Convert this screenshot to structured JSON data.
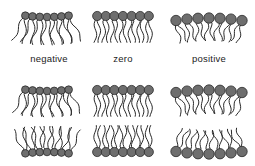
{
  "figure": {
    "labels": [
      "negative",
      "zero",
      "positive"
    ],
    "colors": {
      "head_fill": "#6e6e6e",
      "head_stroke": "#2a2a2a",
      "tail": "#2a2a2a"
    },
    "monolayers": [
      {
        "name": "negative",
        "center_x": 47,
        "head_y": 17,
        "tail_dir": 1,
        "curvature": "negative"
      },
      {
        "name": "zero",
        "center_x": 123,
        "head_y": 16,
        "tail_dir": 1,
        "curvature": "zero"
      },
      {
        "name": "positive",
        "center_x": 209,
        "head_y": 18,
        "tail_dir": 1,
        "curvature": "positive"
      }
    ],
    "bilayers": [
      {
        "name": "negative",
        "center_x": 47,
        "top_y": 91,
        "bottom_y": 152,
        "curvature": "negative"
      },
      {
        "name": "zero",
        "center_x": 123,
        "top_y": 90,
        "bottom_y": 152,
        "curvature": "zero"
      },
      {
        "name": "positive",
        "center_x": 209,
        "top_y": 90,
        "bottom_y": 154,
        "curvature": "positive"
      }
    ],
    "lipids_per_layer": 7
  }
}
